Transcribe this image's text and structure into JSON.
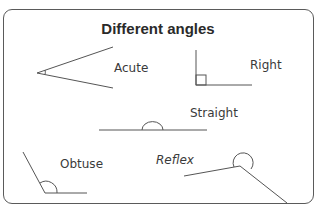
{
  "title": "Different angles",
  "angles": [
    {
      "name": "Acute"
    },
    {
      "name": "Right"
    },
    {
      "name": "Straight"
    },
    {
      "name": "Obtuse"
    },
    {
      "name": "Reflex"
    }
  ],
  "colors": {
    "line": "#555555",
    "frame": "#5a5a5a",
    "text": "#3a3a3a"
  }
}
